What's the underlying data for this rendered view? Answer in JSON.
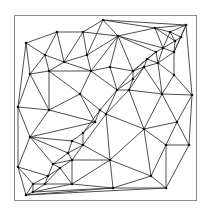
{
  "diagram": {
    "type": "delaunay-triangulation",
    "frame": {
      "x": 14,
      "y": 15,
      "width": 182,
      "height": 185,
      "stroke": "#8a8a8a"
    },
    "edge_color": "#3a3a3a",
    "vertex_color": "#111111",
    "points": [
      [
        26,
        43
      ],
      [
        57,
        32
      ],
      [
        83,
        32
      ],
      [
        103,
        20
      ],
      [
        186,
        25
      ],
      [
        155,
        28
      ],
      [
        170,
        32
      ],
      [
        181,
        37
      ],
      [
        175,
        41
      ],
      [
        45,
        55
      ],
      [
        64,
        62
      ],
      [
        87,
        55
      ],
      [
        118,
        36
      ],
      [
        163,
        48
      ],
      [
        156,
        52
      ],
      [
        174,
        52
      ],
      [
        30,
        74
      ],
      [
        49,
        71
      ],
      [
        91,
        71
      ],
      [
        110,
        67
      ],
      [
        133,
        71
      ],
      [
        147,
        59
      ],
      [
        158,
        63
      ],
      [
        144,
        67
      ],
      [
        133,
        79
      ],
      [
        174,
        75
      ],
      [
        80,
        94
      ],
      [
        117,
        90
      ],
      [
        129,
        90
      ],
      [
        162,
        94
      ],
      [
        192,
        95
      ],
      [
        18,
        107
      ],
      [
        49,
        110
      ],
      [
        100,
        110
      ],
      [
        106,
        114
      ],
      [
        95,
        122
      ],
      [
        144,
        129
      ],
      [
        177,
        122
      ],
      [
        83,
        133
      ],
      [
        30,
        137
      ],
      [
        72,
        141
      ],
      [
        83,
        145
      ],
      [
        166,
        145
      ],
      [
        189,
        145
      ],
      [
        68,
        153
      ],
      [
        110,
        160
      ],
      [
        72,
        160
      ],
      [
        53,
        164
      ],
      [
        60,
        168
      ],
      [
        18,
        167
      ],
      [
        48,
        176
      ],
      [
        151,
        176
      ],
      [
        33,
        184
      ],
      [
        45,
        184
      ],
      [
        72,
        184
      ],
      [
        113,
        188
      ],
      [
        166,
        188
      ],
      [
        33,
        192
      ],
      [
        26,
        195
      ]
    ],
    "edges": [
      [
        0,
        1
      ],
      [
        1,
        2
      ],
      [
        2,
        3
      ],
      [
        3,
        4
      ],
      [
        3,
        5
      ],
      [
        5,
        4
      ],
      [
        5,
        6
      ],
      [
        6,
        4
      ],
      [
        6,
        7
      ],
      [
        7,
        4
      ],
      [
        7,
        8
      ],
      [
        8,
        6
      ],
      [
        5,
        8
      ],
      [
        0,
        9
      ],
      [
        1,
        9
      ],
      [
        1,
        10
      ],
      [
        2,
        10
      ],
      [
        2,
        11
      ],
      [
        3,
        11
      ],
      [
        3,
        12
      ],
      [
        2,
        12
      ],
      [
        11,
        12
      ],
      [
        5,
        12
      ],
      [
        12,
        13
      ],
      [
        5,
        13
      ],
      [
        6,
        13
      ],
      [
        8,
        13
      ],
      [
        8,
        15
      ],
      [
        7,
        15
      ],
      [
        4,
        15
      ],
      [
        13,
        15
      ],
      [
        13,
        14
      ],
      [
        12,
        14
      ],
      [
        0,
        16
      ],
      [
        9,
        16
      ],
      [
        9,
        17
      ],
      [
        9,
        10
      ],
      [
        10,
        17
      ],
      [
        10,
        11
      ],
      [
        10,
        18
      ],
      [
        11,
        18
      ],
      [
        12,
        18
      ],
      [
        12,
        19
      ],
      [
        18,
        19
      ],
      [
        19,
        20
      ],
      [
        12,
        20
      ],
      [
        14,
        20
      ],
      [
        14,
        21
      ],
      [
        20,
        21
      ],
      [
        21,
        22
      ],
      [
        14,
        22
      ],
      [
        13,
        22
      ],
      [
        15,
        22
      ],
      [
        22,
        23
      ],
      [
        21,
        23
      ],
      [
        20,
        23
      ],
      [
        16,
        17
      ],
      [
        17,
        18
      ],
      [
        17,
        26
      ],
      [
        18,
        26
      ],
      [
        18,
        27
      ],
      [
        19,
        27
      ],
      [
        20,
        27
      ],
      [
        20,
        24
      ],
      [
        23,
        24
      ],
      [
        24,
        27
      ],
      [
        24,
        28
      ],
      [
        27,
        28
      ],
      [
        23,
        28
      ],
      [
        22,
        25
      ],
      [
        15,
        25
      ],
      [
        4,
        30
      ],
      [
        25,
        30
      ],
      [
        22,
        29
      ],
      [
        25,
        29
      ],
      [
        29,
        30
      ],
      [
        28,
        29
      ],
      [
        23,
        29
      ],
      [
        0,
        31
      ],
      [
        16,
        31
      ],
      [
        16,
        32
      ],
      [
        17,
        32
      ],
      [
        26,
        32
      ],
      [
        31,
        32
      ],
      [
        26,
        33
      ],
      [
        27,
        33
      ],
      [
        33,
        34
      ],
      [
        27,
        34
      ],
      [
        28,
        34
      ],
      [
        33,
        35
      ],
      [
        26,
        35
      ],
      [
        32,
        35
      ],
      [
        34,
        36
      ],
      [
        28,
        36
      ],
      [
        29,
        36
      ],
      [
        29,
        37
      ],
      [
        30,
        37
      ],
      [
        36,
        37
      ],
      [
        31,
        39
      ],
      [
        32,
        39
      ],
      [
        35,
        39
      ],
      [
        35,
        38
      ],
      [
        33,
        38
      ],
      [
        38,
        40
      ],
      [
        39,
        40
      ],
      [
        38,
        41
      ],
      [
        40,
        41
      ],
      [
        34,
        41
      ],
      [
        34,
        45
      ],
      [
        36,
        45
      ],
      [
        41,
        45
      ],
      [
        36,
        42
      ],
      [
        37,
        42
      ],
      [
        37,
        43
      ],
      [
        42,
        43
      ],
      [
        30,
        43
      ],
      [
        39,
        44
      ],
      [
        40,
        44
      ],
      [
        41,
        44
      ],
      [
        44,
        46
      ],
      [
        41,
        46
      ],
      [
        45,
        46
      ],
      [
        39,
        47
      ],
      [
        44,
        47
      ],
      [
        46,
        47
      ],
      [
        47,
        48
      ],
      [
        46,
        48
      ],
      [
        31,
        49
      ],
      [
        39,
        49
      ],
      [
        47,
        50
      ],
      [
        49,
        50
      ],
      [
        48,
        50
      ],
      [
        45,
        51
      ],
      [
        36,
        51
      ],
      [
        42,
        51
      ],
      [
        42,
        56
      ],
      [
        51,
        56
      ],
      [
        43,
        56
      ],
      [
        49,
        52
      ],
      [
        50,
        52
      ],
      [
        50,
        53
      ],
      [
        52,
        53
      ],
      [
        48,
        53
      ],
      [
        48,
        54
      ],
      [
        53,
        54
      ],
      [
        46,
        54
      ],
      [
        45,
        54
      ],
      [
        54,
        55
      ],
      [
        45,
        55
      ],
      [
        51,
        55
      ],
      [
        55,
        56
      ],
      [
        49,
        58
      ],
      [
        52,
        58
      ],
      [
        52,
        57
      ],
      [
        53,
        57
      ],
      [
        57,
        58
      ],
      [
        54,
        57
      ],
      [
        57,
        55
      ],
      [
        58,
        55
      ],
      [
        58,
        56
      ]
    ]
  }
}
